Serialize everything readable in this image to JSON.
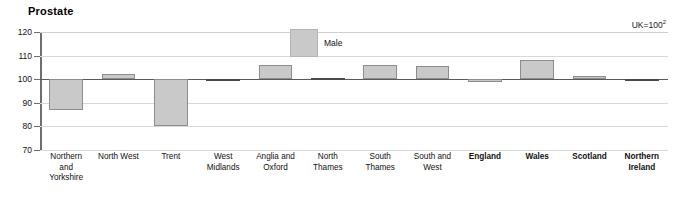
{
  "chart_data": {
    "type": "bar",
    "title": "Prostate",
    "xlabel": "",
    "ylabel": "",
    "ylim": [
      70,
      120
    ],
    "yticks": [
      70,
      80,
      90,
      100,
      110,
      120
    ],
    "grid": true,
    "baseline": 100,
    "legend_position": "inside-top-center",
    "annotation": "UK=100",
    "annotation_superscript": "2",
    "categories": [
      "Northern and Yorkshire",
      "North West",
      "Trent",
      "West Midlands",
      "Anglia and Oxford",
      "North Thames",
      "South Thames",
      "South and West",
      "England",
      "Wales",
      "Scotland",
      "Northern Ireland"
    ],
    "category_lines": [
      [
        "Northern",
        "and",
        "Yorkshire"
      ],
      [
        "North West"
      ],
      [
        "Trent"
      ],
      [
        "West",
        "Midlands"
      ],
      [
        "Anglia and",
        "Oxford"
      ],
      [
        "North",
        "Thames"
      ],
      [
        "South",
        "Thames"
      ],
      [
        "South and",
        "West"
      ],
      [
        "England"
      ],
      [
        "Wales"
      ],
      [
        "Scotland"
      ],
      [
        "Northern",
        "Ireland"
      ]
    ],
    "category_bold": [
      false,
      false,
      false,
      false,
      false,
      false,
      false,
      false,
      true,
      true,
      true,
      true
    ],
    "series": [
      {
        "name": "Male",
        "color": "#c9c9c9",
        "values": [
          87.0,
          102.3,
          80.0,
          100.0,
          106.2,
          100.6,
          106.2,
          105.4,
          98.8,
          108.0,
          101.2,
          99.6
        ]
      }
    ]
  },
  "legend": {
    "label": "Male"
  }
}
